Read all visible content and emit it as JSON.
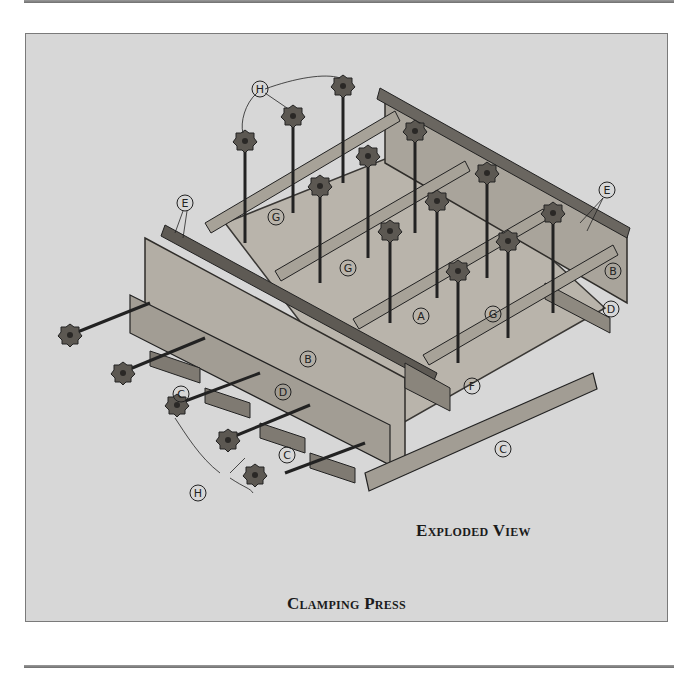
{
  "figure": {
    "title": "Clamping Press",
    "view_caption": "Exploded View",
    "part_labels": {
      "A": "A",
      "B": "B",
      "C": "C",
      "D": "D",
      "E": "E",
      "F": "F",
      "G": "G",
      "H": "H"
    }
  },
  "colors": {
    "panel_background": "#d7d7d7",
    "wood_light": "#c4c0b8",
    "wood_mid": "#9e9990",
    "wood_dark": "#5a5650",
    "ink": "#1b1b1b"
  }
}
